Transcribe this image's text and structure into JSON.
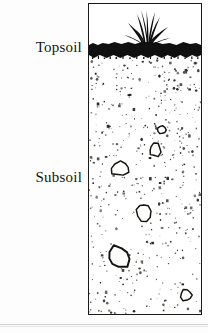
{
  "figure": {
    "type": "soil-profile-cross-section",
    "background_color": "#ffffff",
    "ink_color": "#15140f"
  },
  "labels": {
    "topsoil": "Topsoil",
    "subsoil": "Subsoil"
  },
  "layers": [
    {
      "name": "topsoil",
      "label": "Topsoil",
      "fill": "solid-black",
      "color": "#111010",
      "top_px": 36,
      "height_px": 20,
      "description": "Dark organic-rich surface horizon drawn as a solid black band"
    },
    {
      "name": "subsoil",
      "label": "Subsoil",
      "fill": "stippled",
      "color": "#1b1a17",
      "top_px": 55,
      "height_px": 256,
      "description": "Stippled horizon, dots densest near the topsoil and thinning with depth, containing scattered outlined stones"
    }
  ],
  "vegetation": {
    "name": "grass-tuft",
    "color": "#111010",
    "blade_count": 11,
    "center_x_px": 130,
    "base_y_px": 42
  },
  "stipple": {
    "dot_color": "#1b1a17",
    "dot_count": 520,
    "size_range_px": [
      0.8,
      2.6
    ],
    "density_top": 1.0,
    "density_bottom": 0.42
  },
  "rocks": [
    {
      "name": "rock-1",
      "cx": 32,
      "cy": 110,
      "rx": 9,
      "ry": 7,
      "rotation": -12
    },
    {
      "name": "rock-2",
      "cx": 67,
      "cy": 91,
      "rx": 6,
      "ry": 7,
      "rotation": 18
    },
    {
      "name": "rock-3",
      "cx": 56,
      "cy": 153,
      "rx": 7,
      "ry": 9,
      "rotation": -8
    },
    {
      "name": "rock-4",
      "cx": 30,
      "cy": 198,
      "rx": 12,
      "ry": 11,
      "rotation": 10
    },
    {
      "name": "rock-5",
      "cx": 99,
      "cy": 236,
      "rx": 6,
      "ry": 6,
      "rotation": 0
    },
    {
      "name": "rock-6",
      "cx": 74,
      "cy": 71,
      "rx": 4,
      "ry": 4,
      "rotation": 0
    }
  ],
  "chart_data": {
    "type": "diagram",
    "categories": [
      "Topsoil",
      "Subsoil"
    ],
    "values": [
      20,
      256
    ],
    "ylabel": "Depth (px in figure)",
    "annotations": [
      "Topsoil",
      "Subsoil"
    ],
    "legend": "none",
    "grid": false
  }
}
